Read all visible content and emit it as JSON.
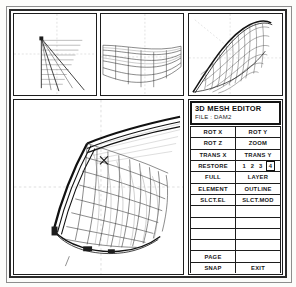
{
  "app": {
    "title": "3D MESH EDITOR",
    "file_label": "FILE : DAM2"
  },
  "viewports": [
    {
      "name": "front-elevation-view",
      "label": ""
    },
    {
      "name": "plan-top-view",
      "label": ""
    },
    {
      "name": "perspective-view",
      "label": ""
    },
    {
      "name": "main-perspective-view",
      "label": ""
    }
  ],
  "menu": {
    "rows": [
      {
        "left": "ROT X",
        "right": "ROT Y"
      },
      {
        "left": "ROT Z",
        "right": "ZOOM"
      },
      {
        "left": "TRANS X",
        "right": "TRANS Y"
      },
      {
        "left": "RESTORE",
        "right": "__NUMSEL__"
      },
      {
        "left": "FULL",
        "right": "LAYER"
      },
      {
        "left": "ELEMENT",
        "right": "OUTLINE"
      },
      {
        "left": "SLCT.EL",
        "right": "SLCT.MOD"
      },
      {
        "left": "",
        "right": ""
      },
      {
        "left": "",
        "right": ""
      },
      {
        "left": "",
        "right": ""
      },
      {
        "left": "",
        "right": ""
      },
      {
        "left": "PAGE",
        "right": ""
      },
      {
        "left": "SNAP",
        "right": "EXIT"
      }
    ],
    "page_selector": {
      "options": [
        "1",
        "2",
        "3",
        "4"
      ],
      "selected": "4"
    }
  },
  "colors": {
    "line": "#1d1d1d",
    "panel_bg": "#ffffff",
    "page_bg": "#fcfcfa",
    "axis": "#b9b9b9"
  }
}
